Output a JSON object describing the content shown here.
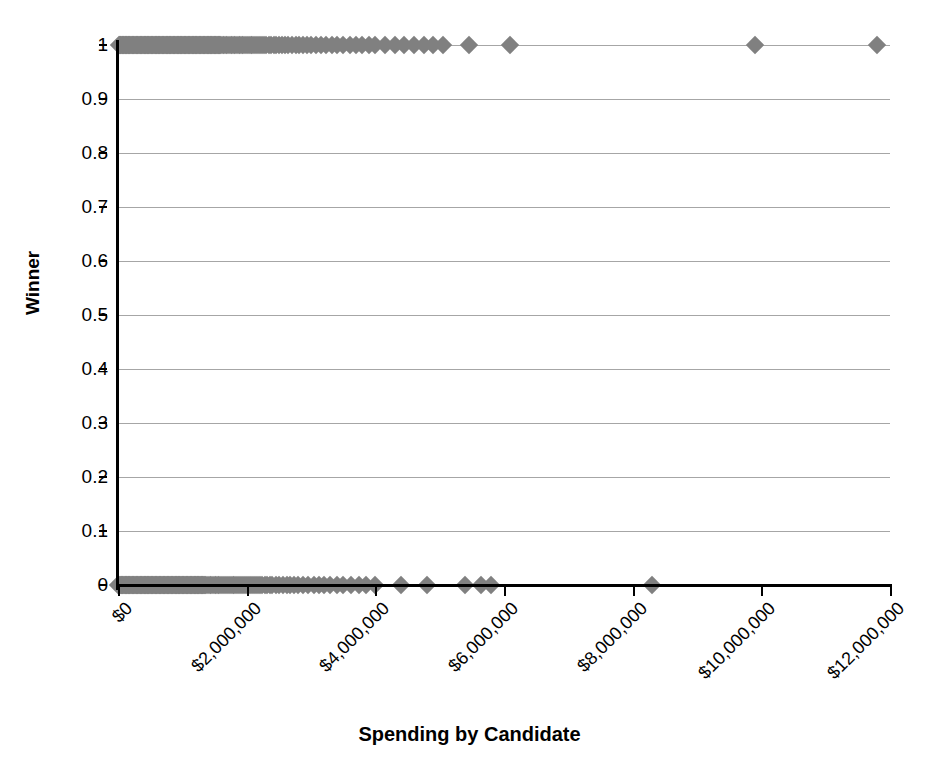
{
  "chart_data": {
    "type": "scatter",
    "title": "",
    "xlabel": "Spending by Candidate",
    "ylabel": "Winner",
    "xlim": [
      0,
      12000000
    ],
    "ylim": [
      0,
      1
    ],
    "grid": true,
    "legend": null,
    "marker": {
      "shape": "diamond",
      "color": "#808080",
      "size": 13
    },
    "xticks": [
      0,
      2000000,
      4000000,
      6000000,
      8000000,
      10000000,
      12000000
    ],
    "xticklabels": [
      "$0",
      "$2,000,000",
      "$4,000,000",
      "$6,000,000",
      "$8,000,000",
      "$10,000,000",
      "$12,000,000"
    ],
    "yticks": [
      0,
      0.1,
      0.2,
      0.3,
      0.4,
      0.5,
      0.6,
      0.7,
      0.8,
      0.9,
      1
    ],
    "yticklabels": [
      "0",
      "0.1",
      "0.2",
      "0.3",
      "0.4",
      "0.5",
      "0.6",
      "0.7",
      "0.8",
      "0.9",
      "1"
    ],
    "series": [
      {
        "name": "Candidates",
        "x": [
          10000,
          25000,
          38000,
          52000,
          61000,
          70000,
          84000,
          95000,
          108000,
          119000,
          130000,
          142000,
          155000,
          166000,
          178000,
          190000,
          203000,
          215000,
          228000,
          240000,
          252000,
          265000,
          277000,
          289000,
          301000,
          314000,
          326000,
          338000,
          350000,
          363000,
          375000,
          387000,
          399000,
          412000,
          424000,
          436000,
          448000,
          461000,
          473000,
          485000,
          497000,
          510000,
          522000,
          534000,
          546000,
          559000,
          571000,
          583000,
          595000,
          608000,
          620000,
          632000,
          644000,
          657000,
          669000,
          681000,
          693000,
          706000,
          718000,
          730000,
          742000,
          755000,
          767000,
          779000,
          791000,
          804000,
          816000,
          828000,
          840000,
          853000,
          865000,
          877000,
          889000,
          902000,
          914000,
          926000,
          938000,
          951000,
          963000,
          975000,
          987000,
          1000000,
          1012000,
          1024000,
          1036000,
          1049000,
          1061000,
          1073000,
          1085000,
          1098000,
          1110000,
          1122000,
          1134000,
          1147000,
          1159000,
          1171000,
          1183000,
          1196000,
          1208000,
          1220000,
          1232000,
          1245000,
          1257000,
          1269000,
          1281000,
          1294000,
          1306000,
          1318000,
          1330000,
          1343000,
          1355000,
          1367000,
          1379000,
          1392000,
          1404000,
          1416000,
          1428000,
          1441000,
          1453000,
          1465000,
          1477000,
          1490000,
          1502000,
          1514000,
          1526000,
          1539000,
          1551000,
          1563000,
          1575000,
          1588000,
          1600000,
          1625000,
          1650000,
          1675000,
          1700000,
          1725000,
          1750000,
          1775000,
          1800000,
          1825000,
          1850000,
          1875000,
          1900000,
          1925000,
          1950000,
          1975000,
          2000000,
          2030000,
          2060000,
          2090000,
          2120000,
          2150000,
          2180000,
          2210000,
          2240000,
          2270000,
          2300000,
          2340000,
          2380000,
          2420000,
          2460000,
          2500000,
          2550000,
          2600000,
          2650000,
          2700000,
          2760000,
          2820000,
          2880000,
          2940000,
          3000000,
          3080000,
          3160000,
          3240000,
          3320000,
          3400000,
          3500000,
          3600000,
          3700000,
          3800000,
          3900000,
          4000000,
          4150000,
          4300000,
          4450000,
          4600000,
          4750000,
          4900000,
          5050000,
          5450000,
          6100000,
          9900000,
          11800000
        ],
        "y": [
          1,
          1,
          1,
          1,
          1,
          1,
          1,
          1,
          1,
          1,
          1,
          1,
          1,
          1,
          1,
          1,
          1,
          1,
          1,
          1,
          1,
          1,
          1,
          1,
          1,
          1,
          1,
          1,
          1,
          1,
          1,
          1,
          1,
          1,
          1,
          1,
          1,
          1,
          1,
          1,
          1,
          1,
          1,
          1,
          1,
          1,
          1,
          1,
          1,
          1,
          1,
          1,
          1,
          1,
          1,
          1,
          1,
          1,
          1,
          1,
          1,
          1,
          1,
          1,
          1,
          1,
          1,
          1,
          1,
          1,
          1,
          1,
          1,
          1,
          1,
          1,
          1,
          1,
          1,
          1,
          1,
          1,
          1,
          1,
          1,
          1,
          1,
          1,
          1,
          1,
          1,
          1,
          1,
          1,
          1,
          1,
          1,
          1,
          1,
          1,
          1,
          1,
          1,
          1,
          1,
          1,
          1,
          1,
          1,
          1,
          1,
          1,
          1,
          1,
          1,
          1,
          1,
          1,
          1,
          1,
          1,
          1,
          1,
          1,
          1,
          1,
          1,
          1,
          1,
          1,
          1,
          1,
          1,
          1,
          1,
          1,
          1,
          1,
          1,
          1,
          1,
          1,
          1,
          1,
          1,
          1,
          1,
          1,
          1,
          1,
          1,
          1,
          1,
          1,
          1,
          1,
          1,
          1,
          1,
          1,
          1,
          1,
          1,
          1,
          1,
          1,
          1,
          1,
          1,
          1,
          1,
          1,
          1,
          1,
          1,
          1,
          1,
          1,
          1,
          1,
          1,
          1,
          1,
          1,
          1,
          1,
          1,
          1,
          1,
          1,
          1,
          1,
          1
        ]
      },
      {
        "name": "Losers",
        "x": [
          5000,
          18000,
          30000,
          43000,
          55000,
          67000,
          80000,
          92000,
          104000,
          117000,
          129000,
          141000,
          154000,
          166000,
          178000,
          191000,
          203000,
          215000,
          228000,
          240000,
          252000,
          265000,
          277000,
          289000,
          302000,
          314000,
          326000,
          339000,
          351000,
          363000,
          376000,
          388000,
          400000,
          413000,
          425000,
          437000,
          450000,
          462000,
          474000,
          487000,
          499000,
          511000,
          524000,
          536000,
          548000,
          561000,
          573000,
          585000,
          598000,
          610000,
          622000,
          635000,
          647000,
          659000,
          672000,
          684000,
          696000,
          709000,
          721000,
          733000,
          746000,
          758000,
          770000,
          783000,
          795000,
          807000,
          820000,
          832000,
          844000,
          857000,
          869000,
          881000,
          894000,
          906000,
          918000,
          931000,
          943000,
          955000,
          968000,
          980000,
          992000,
          1005000,
          1017000,
          1029000,
          1042000,
          1054000,
          1066000,
          1079000,
          1091000,
          1103000,
          1116000,
          1128000,
          1140000,
          1153000,
          1165000,
          1177000,
          1190000,
          1202000,
          1214000,
          1227000,
          1239000,
          1251000,
          1264000,
          1276000,
          1288000,
          1301000,
          1313000,
          1325000,
          1338000,
          1350000,
          1375000,
          1400000,
          1425000,
          1450000,
          1475000,
          1500000,
          1525000,
          1550000,
          1575000,
          1600000,
          1630000,
          1660000,
          1690000,
          1720000,
          1750000,
          1780000,
          1810000,
          1840000,
          1870000,
          1900000,
          1930000,
          1960000,
          1990000,
          2020000,
          2050000,
          2080000,
          2110000,
          2140000,
          2170000,
          2200000,
          2240000,
          2280000,
          2320000,
          2360000,
          2400000,
          2450000,
          2500000,
          2560000,
          2620000,
          2680000,
          2740000,
          2800000,
          2880000,
          2960000,
          3040000,
          3120000,
          3200000,
          3300000,
          3400000,
          3500000,
          3620000,
          3740000,
          3860000,
          4000000,
          4400000,
          4800000,
          5400000,
          5650000,
          5800000,
          8300000
        ],
        "y": [
          0,
          0,
          0,
          0,
          0,
          0,
          0,
          0,
          0,
          0,
          0,
          0,
          0,
          0,
          0,
          0,
          0,
          0,
          0,
          0,
          0,
          0,
          0,
          0,
          0,
          0,
          0,
          0,
          0,
          0,
          0,
          0,
          0,
          0,
          0,
          0,
          0,
          0,
          0,
          0,
          0,
          0,
          0,
          0,
          0,
          0,
          0,
          0,
          0,
          0,
          0,
          0,
          0,
          0,
          0,
          0,
          0,
          0,
          0,
          0,
          0,
          0,
          0,
          0,
          0,
          0,
          0,
          0,
          0,
          0,
          0,
          0,
          0,
          0,
          0,
          0,
          0,
          0,
          0,
          0,
          0,
          0,
          0,
          0,
          0,
          0,
          0,
          0,
          0,
          0,
          0,
          0,
          0,
          0,
          0,
          0,
          0,
          0,
          0,
          0,
          0,
          0,
          0,
          0,
          0,
          0,
          0,
          0,
          0,
          0,
          0,
          0,
          0,
          0,
          0,
          0,
          0,
          0,
          0,
          0,
          0,
          0,
          0,
          0,
          0,
          0,
          0,
          0,
          0,
          0,
          0,
          0,
          0,
          0,
          0,
          0,
          0,
          0,
          0,
          0,
          0,
          0,
          0,
          0,
          0,
          0,
          0,
          0,
          0,
          0,
          0,
          0,
          0,
          0,
          0,
          0,
          0,
          0,
          0,
          0,
          0,
          0,
          0,
          0,
          0,
          0,
          0,
          0,
          0,
          0
        ]
      }
    ]
  }
}
